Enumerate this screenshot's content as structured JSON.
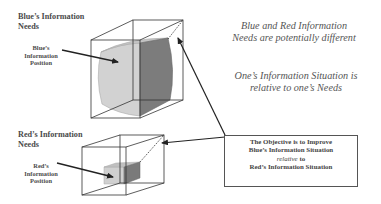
{
  "blue": {
    "heading_line1": "Blue’s Information",
    "heading_line2": "Needs",
    "position_line1": "Blue’s",
    "position_line2": "Information",
    "position_line3": "Position"
  },
  "red": {
    "heading_line1": "Red’s Information",
    "heading_line2": "Needs",
    "position_line1": "Red’s",
    "position_line2": "Information",
    "position_line3": "Position"
  },
  "notes": {
    "note1_line1": "Blue and Red Information",
    "note1_line2": "Needs are potentially different",
    "note2_line1": "One’s Information Situation is",
    "note2_line2": "relative to one’s Needs"
  },
  "objective": {
    "line1": "The Objective is to Improve",
    "line2": "Blue’s Information Situation",
    "line3_italic": "relative",
    "line3_rest": " to",
    "line4": "Red’s Information Situation"
  },
  "colors": {
    "line": "#333333",
    "light_fill": "#cfcfcf",
    "dark_fill": "#7a7a7a"
  }
}
